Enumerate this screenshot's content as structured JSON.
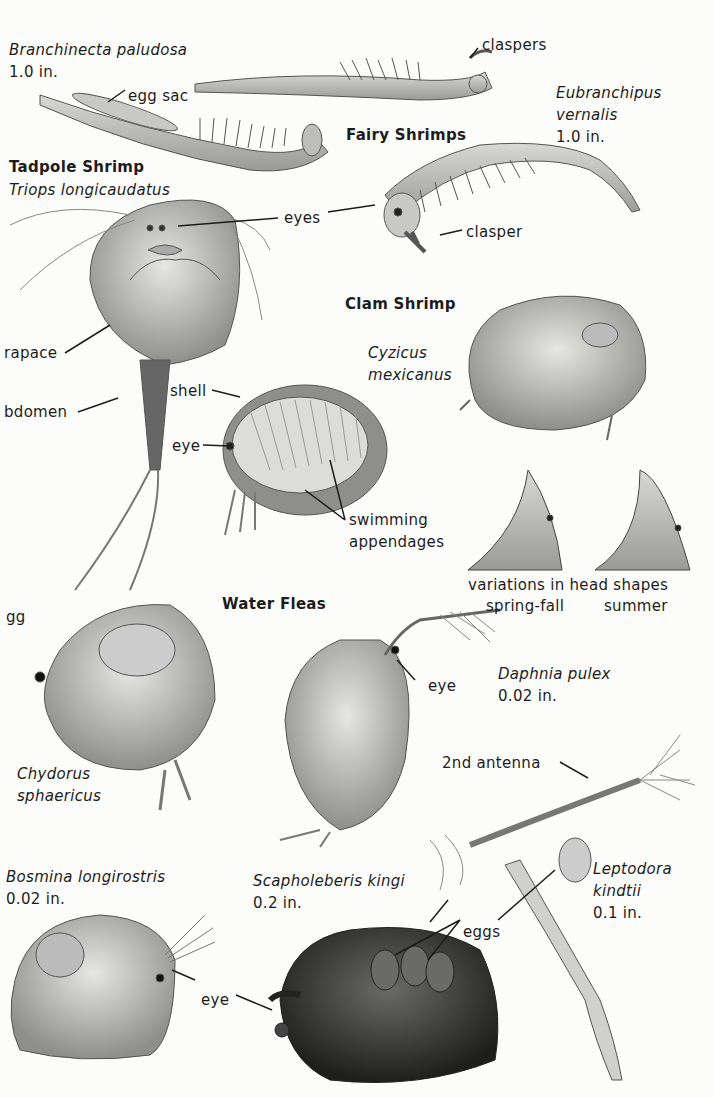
{
  "page": {
    "headings": {
      "fairy_shrimps": "Fairy Shrimps",
      "tadpole_shrimp": "Tadpole Shrimp",
      "clam_shrimp": "Clam Shrimp",
      "water_fleas": "Water Fleas"
    },
    "species": {
      "branchinecta": {
        "name": "Branchinecta paludosa",
        "size": "1.0 in."
      },
      "eubranchipus": {
        "name_line1": "Eubranchipus",
        "name_line2": "vernalis",
        "size": "1.0 in."
      },
      "triops": {
        "name": "Triops longicaudatus"
      },
      "cyzicus": {
        "name_line1": "Cyzicus",
        "name_line2": "mexicanus"
      },
      "chydorus": {
        "name_line1": "Chydorus",
        "name_line2": "sphaericus"
      },
      "daphnia": {
        "name": "Daphnia pulex",
        "size": "0.02 in."
      },
      "bosmina": {
        "name": "Bosmina longirostris",
        "size": "0.02 in."
      },
      "scapholeberis": {
        "name": "Scapholeberis kingi",
        "size": "0.2 in."
      },
      "leptodora": {
        "name_line1": "Leptodora",
        "name_line2": "kindtii",
        "size": "0.1 in."
      }
    },
    "callouts": {
      "claspers": "claspers",
      "egg_sac": "egg sac",
      "eyes_triops": "eyes",
      "clasper": "clasper",
      "carapace": "rapace",
      "abdomen": "bdomen",
      "shell": "shell",
      "eye_clam": "eye",
      "swimming_line1": "swimming",
      "swimming_line2": "appendages",
      "head_shapes_line1": "variations in head shapes",
      "spring_fall": "spring-fall",
      "summer": "summer",
      "egg_partial": "gg",
      "eye_daphnia": "eye",
      "second_antenna": "2nd antenna",
      "eggs": "eggs",
      "eye_bosmina": "eye"
    }
  }
}
